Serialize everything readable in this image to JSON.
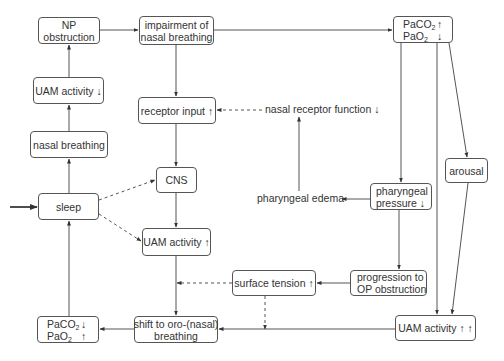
{
  "diagram": {
    "type": "flowchart",
    "nodes": {
      "np_obstruction": {
        "lines": [
          "NP",
          "obstruction"
        ]
      },
      "impairment": {
        "lines": [
          "impairment of",
          "nasal breathing"
        ]
      },
      "gas_top": {
        "rows": [
          {
            "label": "PaCO",
            "sub": "2",
            "arrow": "↑"
          },
          {
            "label": "PaO",
            "sub": "2",
            "arrow": "↓"
          }
        ]
      },
      "uam_down": {
        "lines": [
          "UAM activity ↓"
        ]
      },
      "receptor_input": {
        "lines": [
          "receptor input ↑"
        ]
      },
      "nasal_receptor": {
        "text": "nasal receptor function ↓"
      },
      "nasal_breathing": {
        "lines": [
          "nasal breathing"
        ]
      },
      "arousal": {
        "lines": [
          "arousal"
        ]
      },
      "cns": {
        "lines": [
          "CNS"
        ]
      },
      "pharyngeal_edema": {
        "text": "pharyngeal edema"
      },
      "pharyngeal_pressure": {
        "lines": [
          "pharyngeal",
          "pressure ↓"
        ]
      },
      "sleep": {
        "lines": [
          "sleep"
        ]
      },
      "uam_up": {
        "lines": [
          "UAM activity ↑"
        ]
      },
      "surface_tension": {
        "lines": [
          "surface tension ↑"
        ]
      },
      "progression": {
        "lines": [
          "progression to",
          "OP obstruction"
        ]
      },
      "gas_bottom": {
        "rows": [
          {
            "label": "PaCO",
            "sub": "2",
            "arrow": "↓"
          },
          {
            "label": "PaO",
            "sub": "2",
            "arrow": "↑"
          }
        ]
      },
      "shift": {
        "lines": [
          "shift to oro-(nasal)",
          "breathing"
        ]
      },
      "uam_upup": {
        "lines": [
          "UAM activity ↑ ↑"
        ]
      }
    },
    "edges": [
      {
        "from": "external",
        "to": "sleep",
        "style": "solid-bold"
      },
      {
        "from": "sleep",
        "to": "nasal_breathing",
        "style": "solid"
      },
      {
        "from": "nasal_breathing",
        "to": "uam_down",
        "style": "solid"
      },
      {
        "from": "uam_down",
        "to": "np_obstruction",
        "style": "solid"
      },
      {
        "from": "np_obstruction",
        "to": "impairment",
        "style": "solid"
      },
      {
        "from": "impairment",
        "to": "gas_top",
        "style": "solid"
      },
      {
        "from": "impairment",
        "to": "receptor_input",
        "style": "solid"
      },
      {
        "from": "nasal_receptor",
        "to": "receptor_input",
        "style": "dashed"
      },
      {
        "from": "pharyngeal_edema",
        "to": "nasal_receptor",
        "style": "solid"
      },
      {
        "from": "receptor_input",
        "to": "cns",
        "style": "solid"
      },
      {
        "from": "sleep",
        "to": "cns",
        "style": "dashed"
      },
      {
        "from": "sleep",
        "to": "uam_up",
        "style": "dashed"
      },
      {
        "from": "cns",
        "to": "uam_up",
        "style": "solid"
      },
      {
        "from": "uam_up",
        "to": "shift",
        "style": "solid"
      },
      {
        "from": "gas_top",
        "to": "pharyngeal_pressure",
        "style": "solid"
      },
      {
        "from": "gas_top",
        "to": "uam_upup",
        "style": "solid"
      },
      {
        "from": "gas_top",
        "to": "arousal",
        "style": "solid"
      },
      {
        "from": "arousal",
        "to": "uam_upup",
        "style": "solid"
      },
      {
        "from": "pharyngeal_pressure",
        "to": "pharyngeal_edema",
        "style": "solid"
      },
      {
        "from": "pharyngeal_pressure",
        "to": "progression",
        "style": "solid"
      },
      {
        "from": "progression",
        "to": "surface_tension",
        "style": "solid"
      },
      {
        "from": "surface_tension",
        "to": "uam_up_line",
        "style": "dashed"
      },
      {
        "from": "surface_tension",
        "to": "shift_line",
        "style": "dashed"
      },
      {
        "from": "uam_upup",
        "to": "shift",
        "style": "solid"
      },
      {
        "from": "shift",
        "to": "gas_bottom",
        "style": "solid"
      },
      {
        "from": "gas_bottom",
        "to": "sleep",
        "style": "solid"
      }
    ]
  }
}
